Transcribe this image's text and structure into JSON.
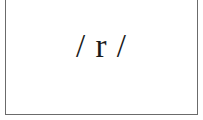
{
  "card": {
    "phoneme_text": "/ r /",
    "border_color": "#6b6b6b",
    "text_color": "#1a1a1a"
  }
}
